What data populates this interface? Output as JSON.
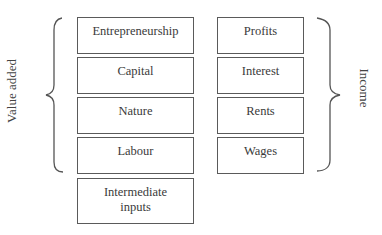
{
  "diagram": {
    "left_group_label": "Value added",
    "right_group_label": "Income",
    "left_column": [
      {
        "label": "Entrepreneurship"
      },
      {
        "label": "Capital"
      },
      {
        "label": "Nature"
      },
      {
        "label": "Labour"
      }
    ],
    "right_column": [
      {
        "label": "Profits"
      },
      {
        "label": "Interest"
      },
      {
        "label": "Rents"
      },
      {
        "label": "Wages"
      }
    ],
    "extra_box": {
      "line1": "Intermediate",
      "line2": "inputs"
    },
    "colors": {
      "border": "#5a5a5a",
      "text": "#3a3a3a",
      "background": "#ffffff"
    }
  }
}
